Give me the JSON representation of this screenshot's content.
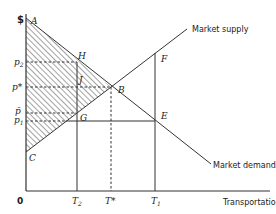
{
  "diagram": {
    "type": "supply-demand",
    "y_axis_label": "$",
    "x_axis_label": "Transportation",
    "origin_label": "0",
    "curves": {
      "supply_label": "Market supply",
      "demand_label": "Market demand"
    },
    "points": {
      "A": "A",
      "B": "B",
      "C": "C",
      "E": "E",
      "F": "F",
      "G": "G",
      "H": "H",
      "J": "J"
    },
    "price_labels": {
      "p2": "p",
      "p2_sub": "2",
      "p_star": "p*",
      "p_bar": "p̄",
      "p1": "p",
      "p1_sub": "1"
    },
    "quantity_labels": {
      "T2": "T",
      "T2_sub": "2",
      "T_star": "T*",
      "T1": "T",
      "T1_sub": "1"
    },
    "colors": {
      "line": "#333333",
      "hatch": "#555555",
      "background": "#ffffff"
    }
  }
}
